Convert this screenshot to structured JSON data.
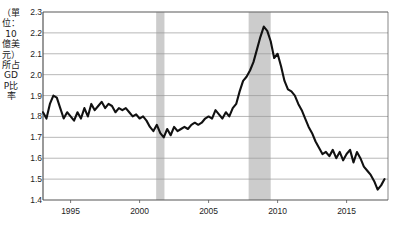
{
  "chart_data": {
    "type": "line",
    "title": "",
    "subtitle": "",
    "xlabel": "",
    "ylabel": "（單位：10億美元）所占GDP比率",
    "xlim": [
      1993.0,
      2018.0
    ],
    "ylim": [
      1.4,
      2.3
    ],
    "grid": true,
    "legend_position": "none",
    "yticks": [
      "2.3",
      "2.2",
      "2.1",
      "2.0",
      "1.9",
      "1.8",
      "1.7",
      "1.6",
      "1.5",
      "1.4"
    ],
    "ytick_values": [
      2.3,
      2.2,
      2.1,
      2.0,
      1.9,
      1.8,
      1.7,
      1.6,
      1.5,
      1.4
    ],
    "xticks": [
      "1995",
      "2000",
      "2005",
      "2010",
      "2015"
    ],
    "xtick_values": [
      1995,
      2000,
      2005,
      2010,
      2015
    ],
    "line_color": "#111111",
    "band_color": "#cccccc",
    "shaded_bands": [
      {
        "start": 2001.2,
        "end": 2001.8
      },
      {
        "start": 2007.9,
        "end": 2009.5
      }
    ],
    "series": [
      {
        "name": "所占GDP比率",
        "x": [
          1993.0,
          1993.25,
          1993.5,
          1993.75,
          1994.0,
          1994.25,
          1994.5,
          1994.75,
          1995.0,
          1995.25,
          1995.5,
          1995.75,
          1996.0,
          1996.25,
          1996.5,
          1996.75,
          1997.0,
          1997.25,
          1997.5,
          1997.75,
          1998.0,
          1998.25,
          1998.5,
          1998.75,
          1999.0,
          1999.25,
          1999.5,
          1999.75,
          2000.0,
          2000.25,
          2000.5,
          2000.75,
          2001.0,
          2001.25,
          2001.5,
          2001.75,
          2002.0,
          2002.25,
          2002.5,
          2002.75,
          2003.0,
          2003.25,
          2003.5,
          2003.75,
          2004.0,
          2004.25,
          2004.5,
          2004.75,
          2005.0,
          2005.25,
          2005.5,
          2005.75,
          2006.0,
          2006.25,
          2006.5,
          2006.75,
          2007.0,
          2007.25,
          2007.5,
          2007.75,
          2008.0,
          2008.25,
          2008.5,
          2008.75,
          2009.0,
          2009.25,
          2009.5,
          2009.75,
          2010.0,
          2010.25,
          2010.5,
          2010.75,
          2011.0,
          2011.25,
          2011.5,
          2011.75,
          2012.0,
          2012.25,
          2012.5,
          2012.75,
          2013.0,
          2013.25,
          2013.5,
          2013.75,
          2014.0,
          2014.25,
          2014.5,
          2014.75,
          2015.0,
          2015.25,
          2015.5,
          2015.75,
          2016.0,
          2016.25,
          2016.5,
          2016.75,
          2017.0,
          2017.25,
          2017.5,
          2017.75
        ],
        "values": [
          1.82,
          1.79,
          1.86,
          1.9,
          1.89,
          1.84,
          1.79,
          1.82,
          1.8,
          1.78,
          1.82,
          1.79,
          1.84,
          1.8,
          1.86,
          1.83,
          1.85,
          1.87,
          1.84,
          1.86,
          1.85,
          1.82,
          1.84,
          1.83,
          1.84,
          1.82,
          1.8,
          1.81,
          1.79,
          1.8,
          1.78,
          1.75,
          1.73,
          1.76,
          1.72,
          1.7,
          1.74,
          1.71,
          1.75,
          1.73,
          1.74,
          1.75,
          1.74,
          1.76,
          1.77,
          1.76,
          1.77,
          1.79,
          1.8,
          1.79,
          1.83,
          1.81,
          1.79,
          1.82,
          1.8,
          1.84,
          1.86,
          1.92,
          1.97,
          1.99,
          2.02,
          2.06,
          2.12,
          2.18,
          2.23,
          2.21,
          2.16,
          2.08,
          2.1,
          2.04,
          1.97,
          1.93,
          1.92,
          1.9,
          1.86,
          1.83,
          1.79,
          1.75,
          1.72,
          1.68,
          1.65,
          1.62,
          1.63,
          1.61,
          1.64,
          1.6,
          1.63,
          1.59,
          1.62,
          1.64,
          1.58,
          1.63,
          1.6,
          1.56,
          1.54,
          1.52,
          1.49,
          1.45,
          1.47,
          1.5
        ]
      }
    ]
  }
}
